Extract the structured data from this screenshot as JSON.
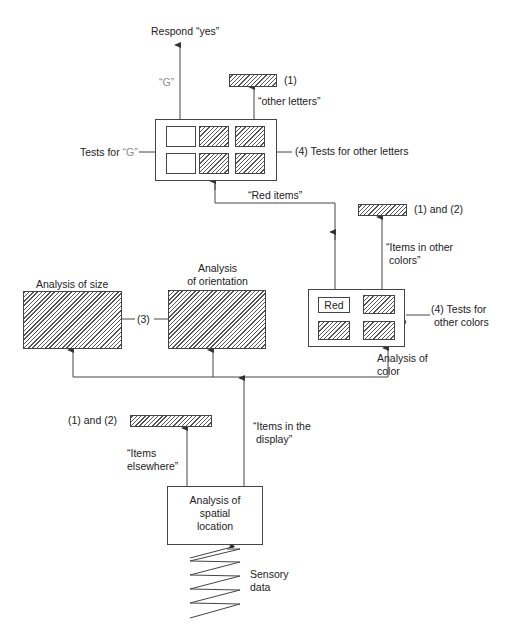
{
  "diagram": {
    "type": "attention-model-flowchart",
    "nodes": {
      "respond_yes": "Respond “yes”",
      "g_label": "“G”",
      "other_letters_ref": "(1)",
      "other_letters_label": "“other letters”",
      "tests_for_g_prefix": "Tests for ",
      "tests_for_g_quoted": "“G”",
      "tests_other_letters": "(4) Tests for other letters",
      "red_items": "“Red items”",
      "other_colors_ref": "(1) and (2)",
      "items_other_colors_line1": "“Items in other",
      "items_other_colors_line2": "colors”",
      "analysis_size": "Analysis of size",
      "analysis_orientation_line1": "Analysis",
      "analysis_orientation_line2": "of orientation",
      "link_3": "(3)",
      "red_box": "Red",
      "tests_other_colors_line1": "(4) Tests for",
      "tests_other_colors_line2": "other colors",
      "analysis_color_line1": "Analysis of",
      "analysis_color_line2": "color",
      "elsewhere_ref": "(1) and (2)",
      "items_elsewhere_line1": "“Items",
      "items_elsewhere_line2": "elsewhere”",
      "items_display_line1": "“Items in the",
      "items_display_line2": "display”",
      "spatial_line1": "Analysis of",
      "spatial_line2": "spatial",
      "spatial_line3": "location",
      "sensory_line1": "Sensory",
      "sensory_line2": "data"
    },
    "colors": {
      "stroke": "#444444",
      "text": "#222222",
      "g_highlight": "#8a8a8a",
      "background": "#ffffff"
    }
  }
}
